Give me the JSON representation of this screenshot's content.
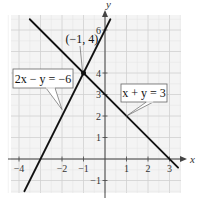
{
  "chart_data": {
    "type": "line",
    "title": "",
    "xlabel": "x",
    "ylabel": "y",
    "xlim": [
      -4.5,
      3.5
    ],
    "ylim": [
      -1.5,
      6.5
    ],
    "grid": true,
    "x_ticks": [
      {
        "value": -4,
        "label": "−4"
      },
      {
        "value": -2,
        "label": "−2"
      },
      {
        "value": -1,
        "label": "−1"
      },
      {
        "value": 1,
        "label": "1"
      },
      {
        "value": 2,
        "label": "2"
      },
      {
        "value": 3,
        "label": "3"
      }
    ],
    "y_ticks": [
      {
        "value": -1,
        "label": "−1"
      },
      {
        "value": 1,
        "label": "1"
      },
      {
        "value": 2,
        "label": "2"
      },
      {
        "value": 3,
        "label": "3"
      },
      {
        "value": 4,
        "label": "4"
      },
      {
        "value": 6,
        "label": "6"
      }
    ],
    "series": [
      {
        "name": "2x − y = −6",
        "slope": 2,
        "intercept": 6,
        "x_range": [
          -3.75,
          0.25
        ]
      },
      {
        "name": "x + y = 3",
        "slope": -1,
        "intercept": 3,
        "x_range": [
          -3.5,
          3.4
        ]
      }
    ],
    "intersection": {
      "x": -1,
      "y": 4,
      "label": "(−1, 4)"
    },
    "annotations": [
      {
        "text": "2x − y = −6",
        "points_to": [
          -2,
          2.3
        ]
      },
      {
        "text": "x + y = 3",
        "points_to": [
          1,
          2
        ]
      },
      {
        "text": "(−1, 4)",
        "points_to": [
          -1,
          4
        ]
      }
    ],
    "colors": {
      "line": "#111111",
      "grid": "#d0d0d0",
      "axis": "#444444",
      "background": "#f2f2f2"
    }
  }
}
